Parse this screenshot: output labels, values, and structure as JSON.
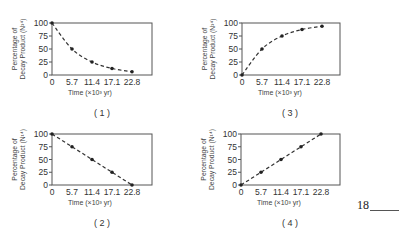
{
  "chart_data": [
    {
      "type": "line",
      "caption": "( 1 )",
      "xlabel": "Time (×10³ yr)",
      "ylabel": "Percentage of Decay Product (N¹⁴)",
      "x": [
        0,
        5.7,
        11.4,
        17.1,
        22.8
      ],
      "values": [
        100,
        50,
        25,
        12.5,
        6.25
      ],
      "x_tick_labels": [
        "0",
        "5.7",
        "11.4",
        "17.1",
        "22.8"
      ],
      "y_tick_labels": [
        "0",
        "25",
        "50",
        "75",
        "100"
      ],
      "ylim": [
        0,
        100
      ],
      "line_style": "dashed",
      "grid": false
    },
    {
      "type": "line",
      "caption": "( 3 )",
      "xlabel": "Time (×10³ yr)",
      "ylabel": "Percentage of Decay Product (N¹⁴)",
      "x": [
        0,
        5.7,
        11.4,
        17.1,
        22.8
      ],
      "values": [
        0,
        50,
        75,
        87.5,
        93.75
      ],
      "x_tick_labels": [
        "0",
        "5.7",
        "11.4",
        "17.1",
        "22.8"
      ],
      "y_tick_labels": [
        "0",
        "25",
        "50",
        "75",
        "100"
      ],
      "ylim": [
        0,
        100
      ],
      "line_style": "dashed",
      "grid": false
    },
    {
      "type": "line",
      "caption": "( 2 )",
      "xlabel": "Time (×10³ yr)",
      "ylabel": "Percentage of Decay Product (N¹⁴)",
      "x": [
        0,
        5.7,
        11.4,
        17.1,
        22.8
      ],
      "values": [
        100,
        75,
        50,
        25,
        0
      ],
      "x_tick_labels": [
        "0",
        "5.7",
        "11.4",
        "17.1",
        "22.8"
      ],
      "y_tick_labels": [
        "0",
        "25",
        "50",
        "75",
        "100"
      ],
      "ylim": [
        0,
        100
      ],
      "line_style": "dashed",
      "grid": false
    },
    {
      "type": "line",
      "caption": "( 4 )",
      "xlabel": "Time (×10³ yr)",
      "ylabel": "Percentage of Decay Product (N¹⁴)",
      "x": [
        0,
        5.7,
        11.4,
        17.1,
        22.8
      ],
      "values": [
        0,
        25,
        50,
        75,
        100
      ],
      "x_tick_labels": [
        "0",
        "5.7",
        "11.4",
        "17.1",
        "22.8"
      ],
      "y_tick_labels": [
        "0",
        "25",
        "50",
        "75",
        "100"
      ],
      "ylim": [
        0,
        100
      ],
      "line_style": "dashed",
      "grid": false
    }
  ],
  "question_number": "18"
}
